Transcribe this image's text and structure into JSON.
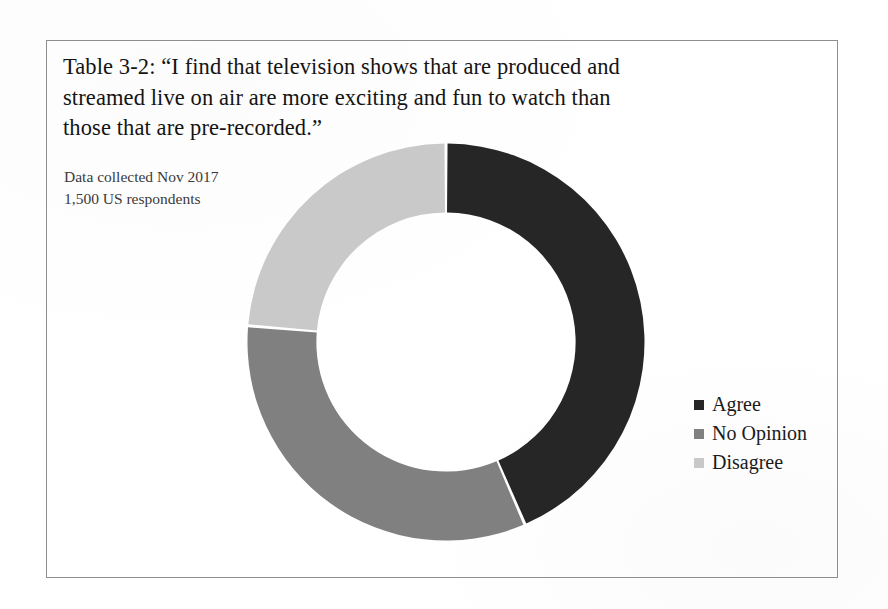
{
  "figure": {
    "frame_border_color": "#8e8e8e",
    "background_color": "#ffffff"
  },
  "title": {
    "line1": "Table 3-2: “I find that television shows that are produced and",
    "line2": "streamed live on air are more exciting and fun to watch than",
    "line3": "those that are pre-recorded.”"
  },
  "subtitle": {
    "line1": "Data collected Nov 2017",
    "line2": "1,500 US respondents"
  },
  "legend": {
    "items": [
      {
        "label": "Agree",
        "color": "#262626"
      },
      {
        "label": "No Opinion",
        "color": "#808080"
      },
      {
        "label": "Disagree",
        "color": "#c9c9c9"
      }
    ]
  },
  "chart_data": {
    "type": "pie",
    "variant": "donut",
    "title": "Table 3-2: “I find that television shows that are produced and streamed live on air are more exciting and fun to watch than those that are pre-recorded.”",
    "subtitle": "Data collected Nov 2017 / 1,500 US respondents",
    "categories": [
      "Agree",
      "No Opinion",
      "Disagree"
    ],
    "values": [
      43.5,
      32.8,
      23.7
    ],
    "value_unit": "percent",
    "counts": [
      653,
      492,
      355
    ],
    "total_respondents": 1500,
    "colors": [
      "#262626",
      "#808080",
      "#c9c9c9"
    ],
    "start_angle_deg": 0,
    "direction": "clockwise",
    "segment_angles_deg": [
      156.4,
      118.2,
      85.4
    ],
    "segment_boundaries_deg": [
      0,
      156.4,
      274.6,
      360
    ],
    "inner_radius_ratio": 0.653,
    "legend_position": "right",
    "data_labels_shown": false,
    "grid": false,
    "xlabel": "",
    "ylabel": ""
  }
}
